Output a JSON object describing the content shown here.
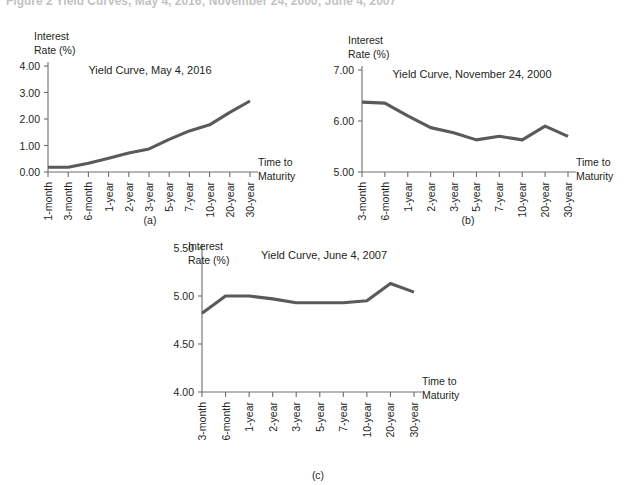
{
  "figure": {
    "caption": "Figure 2  Yield Curves, May 4, 2016; November 24, 2000; June 4, 2007",
    "line_color": "#5a5a5a",
    "axis_color": "#6e6e6e",
    "text_color": "#231f20"
  },
  "axis_labels": {
    "y_line1": "Interest",
    "y_line2": "Rate (%)",
    "x_line1": "Time to",
    "x_line2": "Maturity"
  },
  "panels": [
    {
      "key": "a",
      "letter": "(a)"
    },
    {
      "key": "b",
      "letter": "(b)"
    },
    {
      "key": "c",
      "letter": "(c)"
    }
  ],
  "chart_data": [
    {
      "type": "line",
      "panel": "a",
      "title": "Yield Curve, May 4, 2016",
      "xlabel": "Time to Maturity",
      "ylabel": "Interest Rate (%)",
      "ylim": [
        0.0,
        4.0
      ],
      "ytick_labels": [
        "0.00",
        "1.00",
        "2.00",
        "3.00",
        "4.00"
      ],
      "ytick_values": [
        0.0,
        1.0,
        2.0,
        3.0,
        4.0
      ],
      "grid": false,
      "legend": "none",
      "categories": [
        "1-month",
        "3-month",
        "6-month",
        "1-year",
        "2-year",
        "3-year",
        "5-year",
        "7-year",
        "10-year",
        "20-year",
        "30-year"
      ],
      "values": [
        0.18,
        0.18,
        0.33,
        0.52,
        0.72,
        0.87,
        1.23,
        1.55,
        1.78,
        2.25,
        2.68
      ]
    },
    {
      "type": "line",
      "panel": "b",
      "title": "Yield Curve, November 24, 2000",
      "xlabel": "Time to Maturity",
      "ylabel": "Interest Rate (%)",
      "ylim": [
        5.0,
        7.0
      ],
      "ytick_labels": [
        "5.00",
        "6.00",
        "7.00"
      ],
      "ytick_values": [
        5.0,
        6.0,
        7.0
      ],
      "grid": false,
      "legend": "none",
      "categories": [
        "3-month",
        "6-month",
        "1-year",
        "2-year",
        "3-year",
        "5-year",
        "7-year",
        "10-year",
        "20-year",
        "30-year"
      ],
      "values": [
        6.37,
        6.35,
        6.1,
        5.87,
        5.77,
        5.63,
        5.7,
        5.63,
        5.9,
        5.7
      ]
    },
    {
      "type": "line",
      "panel": "c",
      "title": "Yield Curve, June 4, 2007",
      "xlabel": "Time to Maturity",
      "ylabel": "Interest Rate (%)",
      "ylim": [
        4.0,
        5.5
      ],
      "ytick_labels": [
        "4.00",
        "4.50",
        "5.00",
        "5.50"
      ],
      "ytick_values": [
        4.0,
        4.5,
        5.0,
        5.5
      ],
      "grid": false,
      "legend": "none",
      "categories": [
        "3-month",
        "6-month",
        "1-year",
        "2-year",
        "3-year",
        "5-year",
        "7-year",
        "10-year",
        "20-year",
        "30-year"
      ],
      "values": [
        4.82,
        5.0,
        5.0,
        4.97,
        4.93,
        4.93,
        4.93,
        4.95,
        5.13,
        5.04
      ]
    }
  ]
}
